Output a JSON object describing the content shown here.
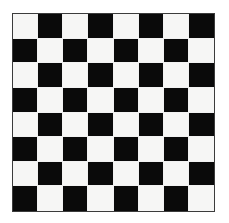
{
  "figure": {
    "name": "checkerboard",
    "background_color": "#ffffff"
  },
  "board": {
    "rows": 8,
    "columns": 8,
    "total_squares": 64,
    "dark_square_count": 32,
    "light_square_count": 32,
    "top_left_square_color": "light",
    "top_right_square_color": "dark",
    "bottom_left_square_color": "dark",
    "bottom_right_square_color": "light",
    "dark_color": "#0a0a0a",
    "light_color": "#f6f6f5",
    "grid_line_color": "#f2f2f2",
    "border_color": "#3c3c3c",
    "border_width_px": 1,
    "square_size_px": 25,
    "board_left_px": 12,
    "board_top_px": 13,
    "board_width_px": 203,
    "board_height_px": 199,
    "pattern": [
      [
        "light",
        "dark",
        "light",
        "dark",
        "light",
        "dark",
        "light",
        "dark"
      ],
      [
        "dark",
        "light",
        "dark",
        "light",
        "dark",
        "light",
        "dark",
        "light"
      ],
      [
        "light",
        "dark",
        "light",
        "dark",
        "light",
        "dark",
        "light",
        "dark"
      ],
      [
        "dark",
        "light",
        "dark",
        "light",
        "dark",
        "light",
        "dark",
        "light"
      ],
      [
        "light",
        "dark",
        "light",
        "dark",
        "light",
        "dark",
        "light",
        "dark"
      ],
      [
        "dark",
        "light",
        "dark",
        "light",
        "dark",
        "light",
        "dark",
        "light"
      ],
      [
        "light",
        "dark",
        "light",
        "dark",
        "light",
        "dark",
        "light",
        "dark"
      ],
      [
        "dark",
        "light",
        "dark",
        "light",
        "dark",
        "light",
        "dark",
        "light"
      ]
    ]
  }
}
